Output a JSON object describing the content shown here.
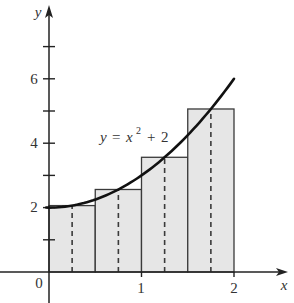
{
  "chart_data": {
    "type": "bar",
    "title": "",
    "xlabel": "x",
    "ylabel": "y",
    "xlim": [
      0,
      2
    ],
    "ylim": [
      0,
      7
    ],
    "grid": false,
    "legend": null,
    "origin_label": "0",
    "x_ticks": [
      1,
      2
    ],
    "x_tick_labels": [
      "1",
      "2"
    ],
    "y_ticks": [
      1,
      2,
      3,
      4,
      5,
      6,
      7
    ],
    "y_labeled_ticks": [
      2,
      4,
      6
    ],
    "y_tick_labels": [
      "2",
      "4",
      "6"
    ],
    "function": {
      "expression": "x^2 + 2",
      "label": {
        "lhs": "y",
        "eq": "=",
        "var": "x",
        "exp": "2",
        "plus": "+",
        "const": "2"
      },
      "x_range": [
        -0.03,
        2
      ],
      "samples": {
        "x": [
          0,
          0.25,
          0.5,
          0.75,
          1,
          1.25,
          1.5,
          1.75,
          2
        ],
        "y": [
          2,
          2.0625,
          2.25,
          2.5625,
          3,
          3.5625,
          4.25,
          5.0625,
          6
        ]
      }
    },
    "rectangles": [
      {
        "x0": 0,
        "x1": 0.5,
        "midpoint": 0.25,
        "height": 2.0625
      },
      {
        "x0": 0.5,
        "x1": 1,
        "midpoint": 0.75,
        "height": 2.5625
      },
      {
        "x0": 1,
        "x1": 1.5,
        "midpoint": 1.25,
        "height": 3.5625
      },
      {
        "x0": 1.5,
        "x1": 2,
        "midpoint": 1.75,
        "height": 5.0625
      }
    ],
    "annotation": "y = x² + 2"
  },
  "colors": {
    "rect_fill": "#e6e6e6",
    "rect_stroke": "#3a3a3a",
    "curve": "#111111",
    "axis": "#222222",
    "text": "#333333"
  }
}
